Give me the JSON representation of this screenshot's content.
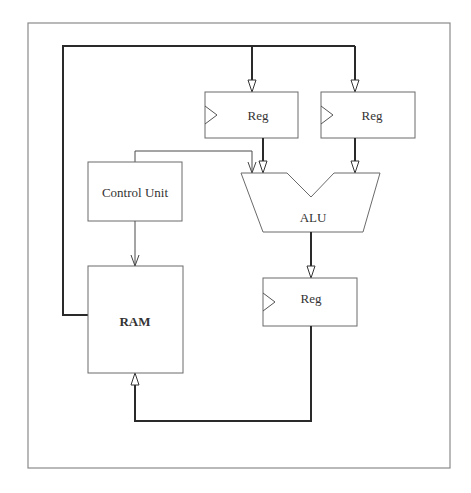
{
  "diagram": {
    "components": {
      "reg_a": {
        "label": "Reg"
      },
      "reg_b": {
        "label": "Reg"
      },
      "reg_out": {
        "label": "Reg"
      },
      "alu": {
        "label": "ALU"
      },
      "control_unit": {
        "label": "Control Unit"
      },
      "ram": {
        "label": "RAM"
      }
    },
    "connections": [
      {
        "from": "RAM",
        "to": "Reg A",
        "type": "bus"
      },
      {
        "from": "RAM",
        "to": "Reg B",
        "type": "bus"
      },
      {
        "from": "Reg A",
        "to": "ALU",
        "type": "bus"
      },
      {
        "from": "Reg B",
        "to": "ALU",
        "type": "bus"
      },
      {
        "from": "Control Unit",
        "to": "ALU",
        "type": "control"
      },
      {
        "from": "Control Unit",
        "to": "RAM",
        "type": "control"
      },
      {
        "from": "ALU",
        "to": "Reg Out",
        "type": "bus"
      },
      {
        "from": "Reg Out",
        "to": "RAM",
        "type": "bus"
      }
    ]
  }
}
